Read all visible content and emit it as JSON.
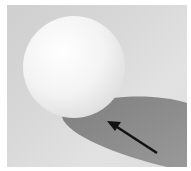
{
  "image": {
    "subject": "white sphere casting shadow with arrow",
    "colors": {
      "background": "#d6d6d6",
      "sphere": "#f4f4f4",
      "shadow": "#8f8f8f",
      "arrow": "#111111",
      "border": "#ffffff"
    }
  }
}
